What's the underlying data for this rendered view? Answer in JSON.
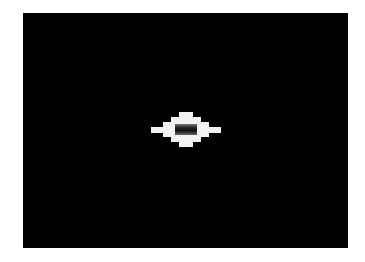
{
  "screen": {
    "background": "#000000",
    "sprite": {
      "name": "diamond-ship",
      "color": "#f2f2f2",
      "core_color": "#1a1a1a"
    }
  }
}
